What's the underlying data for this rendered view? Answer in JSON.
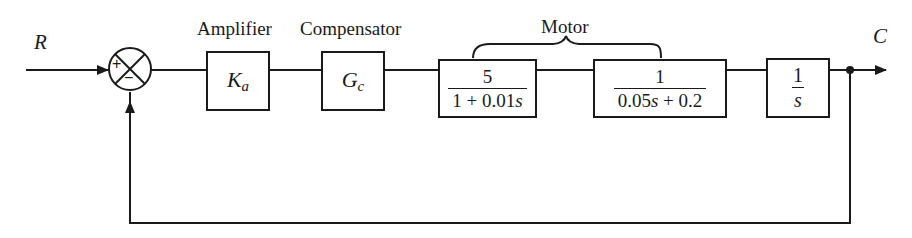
{
  "diagram": {
    "type": "feedback-control-block-diagram",
    "input_signal": "R",
    "output_signal": "C",
    "summing_junction": {
      "plus_sign": "+",
      "minus_sign": "−"
    },
    "captions": {
      "amplifier": "Amplifier",
      "compensator": "Compensator",
      "motor": "Motor"
    },
    "blocks": [
      {
        "id": "amplifier",
        "symbol": "K",
        "subscript": "a"
      },
      {
        "id": "compensator",
        "symbol": "G",
        "subscript": "c"
      },
      {
        "id": "motor-stage-1",
        "numerator": "5",
        "denominator_parts": [
          "1 + 0.01",
          "s"
        ]
      },
      {
        "id": "motor-stage-2",
        "numerator": "1",
        "denominator_parts": [
          "0.05",
          "s",
          " + 0.2"
        ]
      },
      {
        "id": "integrator",
        "numerator": "1",
        "denominator": "s"
      }
    ],
    "feedback": "unity negative feedback",
    "line_color": "#1a1a1a"
  }
}
